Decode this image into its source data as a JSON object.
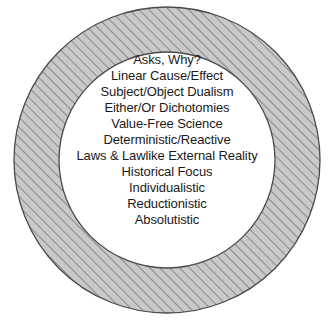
{
  "figure": {
    "type": "concentric-circle-label-diagram",
    "shape_name": "hatched-annulus",
    "colors": {
      "page_background": "#ffffff",
      "ring_fill": "#c9c9c9",
      "hatch_line": "#7d7d7d",
      "ring_outline": "#4a4a4a",
      "inner_fill": "#ffffff",
      "text": "#1a1a1a"
    },
    "geometry": {
      "center_x": 167,
      "center_y": 160,
      "outer_radius": 153,
      "inner_radius": 108,
      "hatch_spacing": 7,
      "hatch_angle_deg": 45
    }
  },
  "inner_circle": {
    "lines": [
      "Asks, Why?",
      "Linear Cause/Effect",
      "Subject/Object Dualism",
      "Either/Or Dichotomies",
      "Value-Free Science",
      "Deterministic/Reactive",
      "Laws & Lawlike External Reality",
      "Historical Focus",
      "Individualistic",
      "Reductionistic",
      "Absolutistic"
    ]
  }
}
